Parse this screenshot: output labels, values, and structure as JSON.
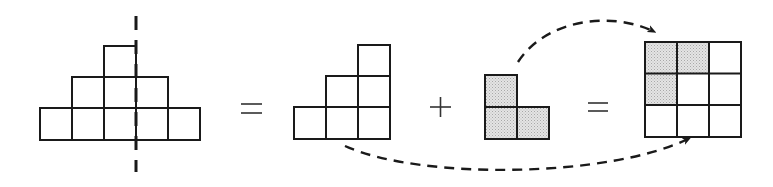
{
  "diagram": {
    "colors": {
      "stroke": "#1a1a1a",
      "shade": "#dcdcdc",
      "background": "#ffffff"
    },
    "cell_size": 32,
    "pyramid": {
      "rows": [
        1,
        3,
        5
      ],
      "symmetry_line": "dashed-vertical",
      "cells": [
        {
          "x": 104,
          "y": 46
        },
        {
          "x": 72,
          "y": 77
        },
        {
          "x": 104,
          "y": 77
        },
        {
          "x": 136,
          "y": 77
        },
        {
          "x": 40,
          "y": 108
        },
        {
          "x": 72,
          "y": 108
        },
        {
          "x": 104,
          "y": 108
        },
        {
          "x": 136,
          "y": 108
        },
        {
          "x": 168,
          "y": 108
        }
      ]
    },
    "operators": [
      "=",
      "+",
      "="
    ],
    "staircase": {
      "rows": [
        1,
        2,
        3
      ],
      "cells": [
        {
          "x": 358,
          "y": 45
        },
        {
          "x": 326,
          "y": 76
        },
        {
          "x": 358,
          "y": 76
        },
        {
          "x": 294,
          "y": 107
        },
        {
          "x": 326,
          "y": 107
        },
        {
          "x": 358,
          "y": 107
        }
      ]
    },
    "l_piece": {
      "shaded": true,
      "cells": [
        {
          "x": 485,
          "y": 75
        },
        {
          "x": 485,
          "y": 107
        },
        {
          "x": 517,
          "y": 107
        }
      ]
    },
    "square_grid": {
      "rows": 3,
      "cols": 3,
      "origin": {
        "x": 645,
        "y": 42
      },
      "shaded_cells": [
        [
          0,
          0
        ],
        [
          0,
          1
        ],
        [
          1,
          0
        ]
      ]
    },
    "arrows": [
      {
        "name": "l-piece-to-square",
        "style": "dashed",
        "from": "l_piece",
        "to": "square_grid"
      },
      {
        "name": "staircase-to-square",
        "style": "dashed",
        "from": "staircase",
        "to": "square_grid"
      }
    ]
  }
}
